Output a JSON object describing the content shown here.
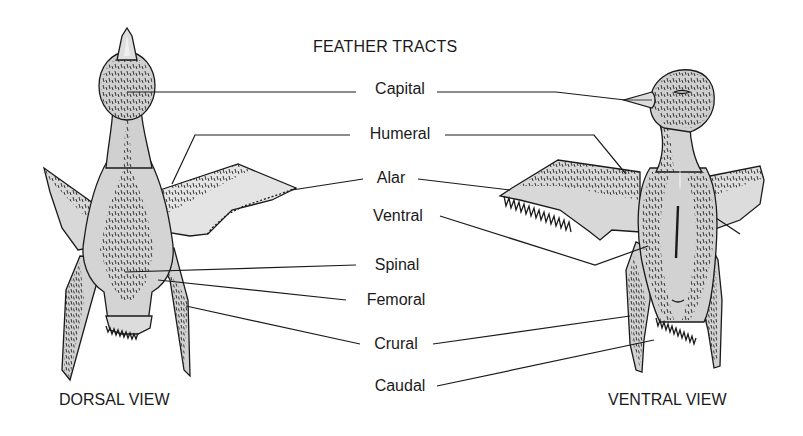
{
  "title": "FEATHER TRACTS",
  "views": {
    "dorsal": "DORSAL VIEW",
    "ventral": "VENTRAL VIEW"
  },
  "labels": [
    {
      "name": "capital",
      "text": "Capital",
      "x": 400,
      "y": 89
    },
    {
      "name": "humeral",
      "text": "Humeral",
      "x": 400,
      "y": 132
    },
    {
      "name": "alar",
      "text": "Alar",
      "x": 400,
      "y": 176
    },
    {
      "name": "ventral",
      "text": "Ventral",
      "x": 400,
      "y": 213
    },
    {
      "name": "spinal",
      "text": "Spinal",
      "x": 397,
      "y": 256
    },
    {
      "name": "femoral",
      "text": "Femoral",
      "x": 398,
      "y": 298
    },
    {
      "name": "crural",
      "text": "Crural",
      "x": 397,
      "y": 341
    },
    {
      "name": "caudal",
      "text": "Caudal",
      "x": 400,
      "y": 383
    }
  ],
  "colors": {
    "ink": "#1a1a1a",
    "body_fill": "#d2d2d2",
    "light_fill": "#e6e6e6",
    "background": "#ffffff"
  }
}
